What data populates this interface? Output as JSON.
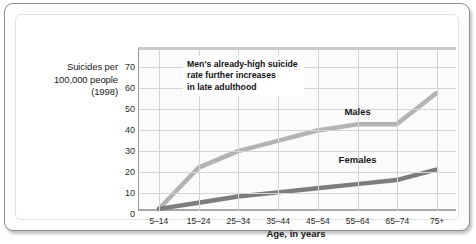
{
  "chart_data": {
    "type": "line",
    "title": "",
    "xlabel": "Age, in years",
    "ylabel": "Suicides per 100,000 people (1998)",
    "ylabel_lines": [
      "Suicides per",
      "100,000 people",
      "(1998)"
    ],
    "categories": [
      "5–14",
      "15–24",
      "25–34",
      "35–44",
      "45–54",
      "55–64",
      "65–74",
      "75+"
    ],
    "ylim": [
      0,
      78
    ],
    "yticks": [
      0,
      10,
      20,
      30,
      40,
      50,
      60,
      70
    ],
    "grid": true,
    "legend": "inline-labels",
    "series": [
      {
        "name": "Males",
        "color": "#b3b3b3",
        "values": [
          1,
          21,
          29,
          34,
          39,
          42,
          42,
          57
        ],
        "label_x_category": "55–64",
        "label_y_value": 49
      },
      {
        "name": "Females",
        "color": "#7d7d7d",
        "values": [
          1,
          4,
          7,
          9,
          11,
          13,
          15,
          20
        ],
        "label_x_category": "55–64",
        "label_y_value": 26
      }
    ],
    "annotations": [
      {
        "lines": [
          "Men's already-high suicide",
          "rate further increases",
          "in late adulthood"
        ]
      }
    ]
  }
}
